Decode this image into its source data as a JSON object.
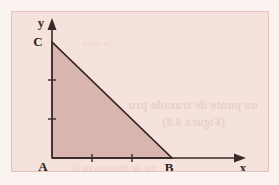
{
  "figure": {
    "kind": "geometry-diagram",
    "caption_visible": false,
    "frame": {
      "x": 11,
      "y": 11,
      "width": 258,
      "height": 161,
      "background_color": "#f6e2dc",
      "border_color": "#e5c3bb"
    },
    "page_background_color": "#fbf3f0"
  },
  "axes": {
    "x_label": "x",
    "y_label": "y",
    "axis_color": "#3a2a27",
    "origin": {
      "x": 52,
      "y": 158
    },
    "x_axis": {
      "from_x": 52,
      "to_x": 243,
      "y": 158,
      "arrow": true
    },
    "y_axis": {
      "x": 52,
      "from_y": 158,
      "to_y": 22,
      "arrow": true
    },
    "x_ticks": [
      {
        "x": 92,
        "label": ""
      },
      {
        "x": 132,
        "label": ""
      }
    ],
    "y_ticks": [
      {
        "y": 119,
        "label": ""
      },
      {
        "y": 80,
        "label": ""
      }
    ],
    "tick_color": "#3a2a27"
  },
  "triangle": {
    "name": "triangle-ABC",
    "fill_color": "#d8b5ae",
    "stroke_color": "#3a2a27",
    "vertices": [
      {
        "label": "A",
        "x": 52,
        "y": 158,
        "label_dx": -9,
        "label_dy": 13
      },
      {
        "label": "B",
        "x": 172,
        "y": 158,
        "label_dx": -3,
        "label_dy": 14
      },
      {
        "label": "C",
        "x": 52,
        "y": 42,
        "label_dx": -14,
        "label_dy": 4
      }
    ]
  },
  "ghost_text": {
    "line_1": "un punto de trazado pru",
    "line_2": "(Figura 4.8)",
    "line_3": "eje de abscisas en la",
    "line_4": "la recta"
  },
  "colors": {
    "triangle_fill": "#d8b5ae",
    "ink": "#3a2a27",
    "frame_bg": "#f6e2dc",
    "paper": "#fbf3f0"
  }
}
